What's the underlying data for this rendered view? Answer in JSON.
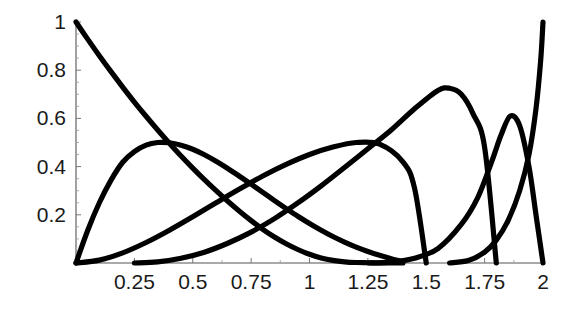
{
  "chart_data": {
    "type": "line",
    "title": "",
    "subtitle": "",
    "xlabel": "",
    "ylabel": "",
    "xlim": [
      0,
      2
    ],
    "ylim": [
      0,
      1
    ],
    "grid": false,
    "legend": "none",
    "annotations": [],
    "x_ticks": [
      {
        "value": 0.25,
        "label": "0.25"
      },
      {
        "value": 0.5,
        "label": "0.5"
      },
      {
        "value": 0.75,
        "label": "0.75"
      },
      {
        "value": 1,
        "label": "1"
      },
      {
        "value": 1.25,
        "label": "1.25"
      },
      {
        "value": 1.5,
        "label": "1.5"
      },
      {
        "value": 1.75,
        "label": "1.75"
      },
      {
        "value": 2,
        "label": "2"
      }
    ],
    "y_ticks": [
      {
        "value": 0.2,
        "label": "0.2"
      },
      {
        "value": 0.4,
        "label": "0.4"
      },
      {
        "value": 0.6,
        "label": "0.6"
      },
      {
        "value": 0.8,
        "label": "0.8"
      },
      {
        "value": 1.0,
        "label": "1"
      }
    ],
    "x_minor_ticks": [
      0.125,
      0.375,
      0.625,
      0.875,
      1.125,
      1.375,
      1.625,
      1.875
    ],
    "y_minor_ticks": [
      0.05,
      0.1,
      0.15,
      0.25,
      0.3,
      0.35,
      0.45,
      0.5,
      0.55,
      0.65,
      0.7,
      0.75,
      0.85,
      0.9,
      0.95
    ],
    "line_color": "#000000",
    "background_color": "#ffffff",
    "axis_color": "#555555",
    "series": [
      {
        "name": "curve-1",
        "color": "#000000",
        "x": [
          0.0,
          0.05,
          0.1,
          0.15,
          0.2,
          0.25,
          0.3,
          0.35,
          0.4,
          0.45,
          0.5,
          0.55,
          0.6,
          0.65,
          0.7,
          0.75,
          0.8,
          0.85,
          0.9,
          0.95,
          1.0,
          1.05,
          1.1,
          1.15,
          1.2,
          1.25,
          1.3,
          1.35,
          1.4
        ],
        "y": [
          1.0,
          0.929,
          0.86,
          0.794,
          0.73,
          0.668,
          0.609,
          0.552,
          0.497,
          0.444,
          0.394,
          0.346,
          0.3,
          0.256,
          0.215,
          0.176,
          0.14,
          0.108,
          0.08,
          0.056,
          0.036,
          0.021,
          0.011,
          0.005,
          0.002,
          0.001,
          0.0,
          0.0,
          0.0
        ]
      },
      {
        "name": "curve-2",
        "color": "#000000",
        "x": [
          0.0,
          0.05,
          0.1,
          0.15,
          0.2,
          0.25,
          0.3,
          0.35,
          0.4,
          0.45,
          0.5,
          0.55,
          0.6,
          0.65,
          0.7,
          0.75,
          0.8,
          0.85,
          0.9,
          0.95,
          1.0,
          1.05,
          1.1,
          1.15,
          1.2,
          1.25,
          1.3,
          1.35,
          1.4
        ],
        "y": [
          0.0,
          0.135,
          0.25,
          0.344,
          0.418,
          0.462,
          0.489,
          0.5,
          0.499,
          0.489,
          0.472,
          0.449,
          0.422,
          0.392,
          0.36,
          0.327,
          0.293,
          0.259,
          0.226,
          0.194,
          0.164,
          0.136,
          0.11,
          0.087,
          0.066,
          0.048,
          0.032,
          0.018,
          0.005
        ]
      },
      {
        "name": "curve-3",
        "color": "#000000",
        "x": [
          0.0,
          0.1,
          0.2,
          0.3,
          0.4,
          0.5,
          0.6,
          0.7,
          0.8,
          0.9,
          1.0,
          1.1,
          1.2,
          1.3,
          1.4,
          1.45,
          1.5
        ],
        "y": [
          0.0,
          0.012,
          0.042,
          0.085,
          0.136,
          0.192,
          0.25,
          0.307,
          0.361,
          0.409,
          0.45,
          0.481,
          0.5,
          0.493,
          0.42,
          0.31,
          0.0
        ]
      },
      {
        "name": "curve-4",
        "color": "#000000",
        "x": [
          0.25,
          0.35,
          0.45,
          0.55,
          0.65,
          0.75,
          0.85,
          0.95,
          1.05,
          1.15,
          1.25,
          1.35,
          1.45,
          1.55,
          1.6,
          1.65,
          1.7,
          1.75,
          1.8
        ],
        "y": [
          0.0,
          0.005,
          0.02,
          0.045,
          0.082,
          0.128,
          0.184,
          0.249,
          0.32,
          0.396,
          0.474,
          0.552,
          0.64,
          0.716,
          0.725,
          0.7,
          0.62,
          0.48,
          0.0
        ]
      },
      {
        "name": "curve-5",
        "color": "#000000",
        "x": [
          1.25,
          1.35,
          1.45,
          1.55,
          1.65,
          1.72,
          1.78,
          1.82,
          1.86,
          1.9,
          1.94,
          1.97,
          2.0
        ],
        "y": [
          0.0,
          0.004,
          0.02,
          0.06,
          0.16,
          0.27,
          0.42,
          0.53,
          0.61,
          0.57,
          0.4,
          0.2,
          0.0
        ]
      },
      {
        "name": "curve-6",
        "color": "#000000",
        "x": [
          1.6,
          1.68,
          1.75,
          1.8,
          1.85,
          1.9,
          1.94,
          1.97,
          1.99,
          2.0
        ],
        "y": [
          0.0,
          0.01,
          0.045,
          0.095,
          0.175,
          0.3,
          0.45,
          0.64,
          0.84,
          1.0
        ]
      }
    ]
  },
  "plot": {
    "origin_px": {
      "x": 76,
      "y": 263
    },
    "x_axis_end_px": 543,
    "y_axis_top_px": 22
  }
}
